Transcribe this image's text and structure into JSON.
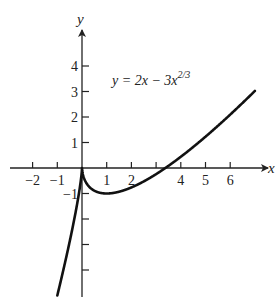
{
  "chart_data": {
    "type": "line",
    "title": "",
    "equation_label": {
      "lhs": "y = 2x − 3x",
      "exponent": "2/3"
    },
    "function": "y = 2x - 3x^(2/3)",
    "xlabel": "x",
    "ylabel": "y",
    "xlim": [
      -2.5,
      7.3
    ],
    "ylim": [
      -5.0,
      5.4
    ],
    "x_ticks": [
      -2,
      -1,
      1,
      2,
      3,
      4,
      5,
      6
    ],
    "x_tick_labels": [
      "−2",
      "−1",
      "1",
      "2",
      "",
      "4",
      "5",
      "6"
    ],
    "y_ticks": [
      4,
      3,
      2,
      1,
      -1,
      -2,
      -3,
      -4
    ],
    "y_tick_labels": [
      "4",
      "3",
      "2",
      "1",
      "−1",
      "",
      "",
      ""
    ],
    "grid": false,
    "legend": null,
    "series": [
      {
        "name": "y = 2x − 3x^(2/3)",
        "x": [
          -1.0,
          -0.5,
          -0.2,
          -0.05,
          0,
          0.05,
          0.2,
          0.5,
          1,
          1.5,
          2,
          3,
          3.375,
          4,
          5,
          6,
          7
        ],
        "y": [
          -5.0,
          -2.89,
          -1.43,
          -0.51,
          0,
          -0.31,
          -0.63,
          -0.89,
          -1.0,
          -0.93,
          -0.76,
          -0.24,
          0,
          0.44,
          1.23,
          2.09,
          3.02
        ]
      }
    ],
    "key_points": {
      "cusp": [
        0,
        0
      ],
      "local_min": [
        1,
        -1
      ],
      "x_intercept": [
        3.375,
        0
      ]
    }
  },
  "axes": {
    "x_label": "x",
    "y_label": "y"
  }
}
